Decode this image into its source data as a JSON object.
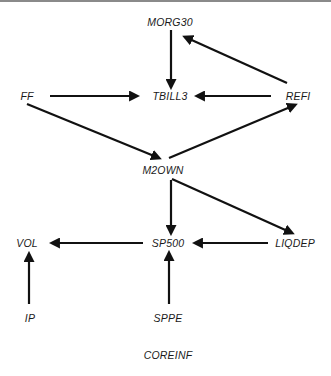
{
  "diagram": {
    "type": "directed-graph",
    "nodes": [
      {
        "id": "MORG30",
        "label": "MORG30",
        "x": 170,
        "y": 22
      },
      {
        "id": "TBILL3",
        "label": "TBILL3",
        "x": 170,
        "y": 96
      },
      {
        "id": "FF",
        "label": "FF",
        "x": 27,
        "y": 96
      },
      {
        "id": "REFI",
        "label": "REFI",
        "x": 298,
        "y": 96
      },
      {
        "id": "M2OWN",
        "label": "M2OWN",
        "x": 163,
        "y": 170
      },
      {
        "id": "VOL",
        "label": "VOL",
        "x": 27,
        "y": 243
      },
      {
        "id": "SP500",
        "label": "SP500",
        "x": 168,
        "y": 243
      },
      {
        "id": "LIQDEP",
        "label": "LIQDEP",
        "x": 295,
        "y": 243
      },
      {
        "id": "IP",
        "label": "IP",
        "x": 30,
        "y": 318
      },
      {
        "id": "SPPE",
        "label": "SPPE",
        "x": 168,
        "y": 318
      },
      {
        "id": "COREINF",
        "label": "COREINF",
        "x": 168,
        "y": 355
      }
    ],
    "edges": [
      {
        "from": "MORG30",
        "to": "TBILL3",
        "x1": 171,
        "y1": 30,
        "x2": 171,
        "y2": 87
      },
      {
        "from": "REFI",
        "to": "MORG30",
        "x1": 287,
        "y1": 83,
        "x2": 185,
        "y2": 37
      },
      {
        "from": "FF",
        "to": "TBILL3",
        "x1": 50,
        "y1": 96,
        "x2": 137,
        "y2": 96
      },
      {
        "from": "REFI",
        "to": "TBILL3",
        "x1": 271,
        "y1": 96,
        "x2": 197,
        "y2": 96
      },
      {
        "from": "FF",
        "to": "M2OWN",
        "x1": 27,
        "y1": 104,
        "x2": 159,
        "y2": 158
      },
      {
        "from": "M2OWN",
        "to": "REFI",
        "x1": 169,
        "y1": 158,
        "x2": 295,
        "y2": 105
      },
      {
        "from": "M2OWN",
        "to": "SP500",
        "x1": 171,
        "y1": 180,
        "x2": 171,
        "y2": 233
      },
      {
        "from": "M2OWN",
        "to": "LIQDEP",
        "x1": 172,
        "y1": 179,
        "x2": 292,
        "y2": 233
      },
      {
        "from": "SP500",
        "to": "VOL",
        "x1": 143,
        "y1": 243,
        "x2": 52,
        "y2": 243
      },
      {
        "from": "LIQDEP",
        "to": "SP500",
        "x1": 268,
        "y1": 243,
        "x2": 195,
        "y2": 243
      },
      {
        "from": "IP",
        "to": "VOL",
        "x1": 29,
        "y1": 304,
        "x2": 29,
        "y2": 254
      },
      {
        "from": "SPPE",
        "to": "SP500",
        "x1": 169,
        "y1": 304,
        "x2": 169,
        "y2": 253
      }
    ],
    "colors": {
      "edge": "#111111",
      "text": "#1a1a1a",
      "rule": "#8a8a8a"
    }
  }
}
